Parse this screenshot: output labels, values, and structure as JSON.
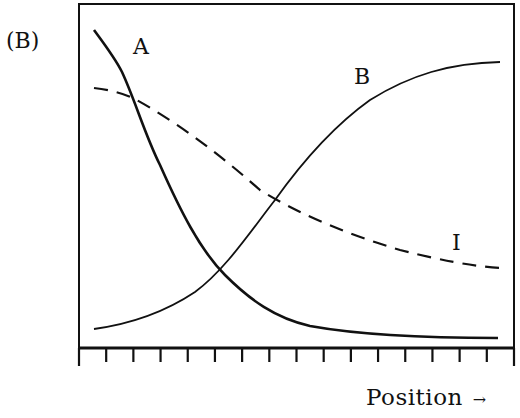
{
  "panel_label": "(B)",
  "x_axis": {
    "label": "Position",
    "arrow": "→",
    "tick_count": 17
  },
  "curve_labels": {
    "A": "A",
    "B": "B",
    "I": "I"
  },
  "colors": {
    "ink": "#111111",
    "background": "#ffffff"
  },
  "chart_data": {
    "type": "line",
    "title": "(B)",
    "xlabel": "Position →",
    "ylabel": "",
    "x_ticks": 17,
    "tick_labels": [],
    "grid": false,
    "legend": "inline curve labels",
    "x": [
      0,
      1,
      2,
      3,
      4,
      5,
      6,
      7,
      8,
      9,
      10,
      11,
      12,
      13,
      14,
      15,
      16
    ],
    "ylim": [
      0,
      1
    ],
    "series": [
      {
        "name": "A",
        "style": "solid-thick",
        "values": [
          0.96,
          0.85,
          0.65,
          0.42,
          0.25,
          0.16,
          0.1,
          0.07,
          0.05,
          0.04,
          0.03,
          0.025,
          0.02,
          0.02,
          0.015,
          0.015,
          0.015
        ]
      },
      {
        "name": "B",
        "style": "solid-thin",
        "values": [
          0.03,
          0.05,
          0.08,
          0.14,
          0.22,
          0.33,
          0.46,
          0.58,
          0.68,
          0.75,
          0.8,
          0.84,
          0.86,
          0.88,
          0.89,
          0.89,
          0.89
        ]
      },
      {
        "name": "I",
        "style": "dashed",
        "values": [
          0.78,
          0.75,
          0.7,
          0.65,
          0.6,
          0.55,
          0.5,
          0.45,
          0.41,
          0.38,
          0.35,
          0.33,
          0.31,
          0.29,
          0.28,
          0.27,
          0.26
        ]
      }
    ]
  }
}
